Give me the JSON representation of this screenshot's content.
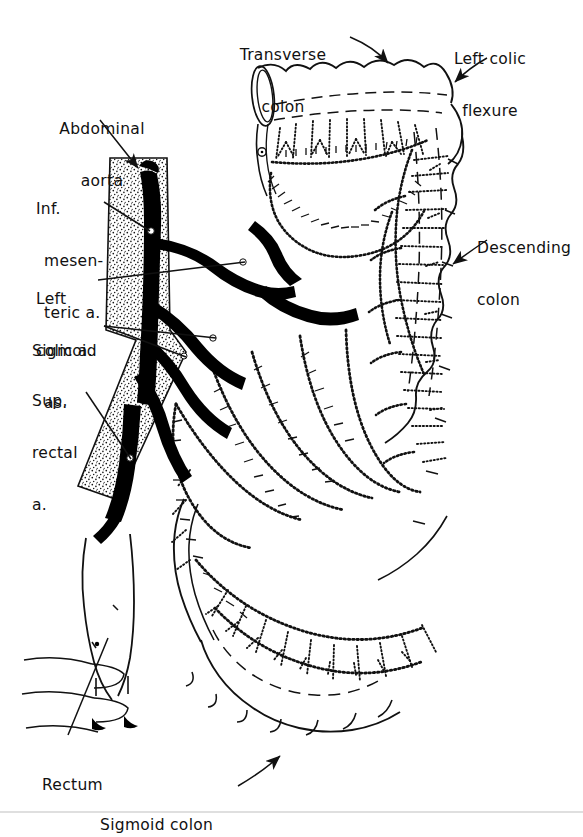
{
  "figure": {
    "medium": "line drawing / anatomical plate",
    "background_color": "#ffffff",
    "ink_color": "#111111",
    "vessel_fill_color": "#000000",
    "aorta_texture": "stipple"
  },
  "labels": [
    {
      "id": "transverse-colon",
      "text_line1": "Transverse",
      "text_line2": "colon",
      "x": 283,
      "y": 14,
      "align": "center",
      "leader": "arrow",
      "points_to": "transverse colon superior haustral border"
    },
    {
      "id": "left-colic-flexure",
      "text_line1": "Left colic",
      "text_line2": "flexure",
      "x": 447,
      "y": 18,
      "align": "left",
      "leader": "arrow",
      "points_to": "splenic (left colic) flexure"
    },
    {
      "id": "abdominal-aorta",
      "text_line1": "Abdominal",
      "text_line2": "aorta",
      "x": 52,
      "y": 88,
      "align": "left",
      "leader": "arrow",
      "points_to": "stippled aortic band"
    },
    {
      "id": "inferior-mesenteric-artery",
      "text_line1": "Inf.",
      "text_line2": "mesen-",
      "text_line3": "teric a.",
      "x": 38,
      "y": 168,
      "align": "left",
      "leader": "line",
      "points_to": "inferior mesenteric artery origin"
    },
    {
      "id": "left-colic-artery",
      "text_line1": "Left",
      "text_line2": "colic a.",
      "x": 38,
      "y": 256,
      "align": "left",
      "leader": "line",
      "points_to": "left colic artery bifurcation"
    },
    {
      "id": "sigmoid-arteries",
      "text_line1": "Sigmoid",
      "text_line2": "as.",
      "x": 32,
      "y": 310,
      "align": "left",
      "leader": "double-line",
      "points_to": "sigmoid arteries"
    },
    {
      "id": "superior-rectal-artery",
      "text_line1": "Sup.",
      "text_line2": "rectal",
      "text_line3": "a.",
      "x": 32,
      "y": 360,
      "align": "left",
      "leader": "line",
      "points_to": "superior rectal artery"
    },
    {
      "id": "descending-colon",
      "text_line1": "Descending",
      "text_line2": "colon",
      "x": 477,
      "y": 207,
      "align": "left",
      "leader": "arrow",
      "points_to": "descending colon lateral wall"
    },
    {
      "id": "rectum",
      "text_line1": "Rectum",
      "x": 42,
      "y": 745,
      "align": "left",
      "leader": "line",
      "points_to": "rectum"
    },
    {
      "id": "sigmoid-colon",
      "text_line1": "Sigmoid colon",
      "x": 100,
      "y": 785,
      "align": "left",
      "leader": "arrow",
      "points_to": "sigmoid colon inferior loop"
    }
  ],
  "structures": [
    {
      "id": "transverse-colon-segment",
      "kind": "bowel",
      "note": "cut end at upper left, haustrated tube running right"
    },
    {
      "id": "left-colic-flexure-bend",
      "kind": "bowel",
      "note": "sharp bend top right"
    },
    {
      "id": "descending-colon-segment",
      "kind": "bowel",
      "note": "vertical haustrated column along right margin"
    },
    {
      "id": "sigmoid-colon-loop",
      "kind": "bowel",
      "note": "U-shaped loop across the bottom"
    },
    {
      "id": "rectum-segment",
      "kind": "bowel",
      "note": "descends in front of the sacrum, lower left"
    },
    {
      "id": "sacrum",
      "kind": "bone",
      "note": "outlined vertebral bodies, lower left"
    },
    {
      "id": "abdominal-aorta-band",
      "kind": "vessel",
      "note": "stippled vertical band on the left"
    },
    {
      "id": "inferior-mesenteric-artery-trunk",
      "kind": "vessel",
      "note": "solid black trunk from aorta"
    },
    {
      "id": "left-colic-artery-branch",
      "kind": "vessel",
      "note": "ascending branch, bifurcates"
    },
    {
      "id": "sigmoid-arteries-branches",
      "kind": "vessel",
      "note": "fan of branches to sigmoid"
    },
    {
      "id": "superior-rectal-artery-branch",
      "kind": "vessel",
      "note": "continues down to rectum"
    },
    {
      "id": "marginal-artery-arcades",
      "kind": "vessel",
      "note": "dotted/hatched arcade loops along the mesenteric border"
    },
    {
      "id": "vasa-recta",
      "kind": "vessel",
      "note": "short straight vessels to the bowel wall"
    }
  ]
}
